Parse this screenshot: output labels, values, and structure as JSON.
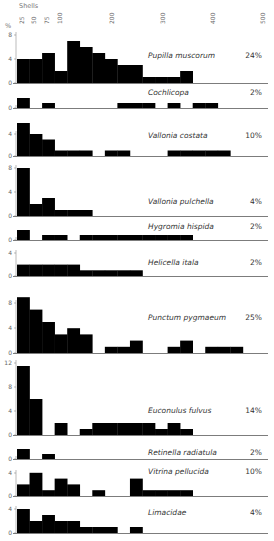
{
  "chart_data": {
    "type": "bar",
    "title": "",
    "xlabel": "Shells",
    "ylabel": "%",
    "x_ticks": [
      "25",
      "50",
      "75",
      "100",
      "200",
      "300",
      "400",
      "500"
    ],
    "x_tick_values": [
      25,
      50,
      75,
      100,
      200,
      300,
      400,
      500
    ],
    "bin_width": 25,
    "xlim": [
      0,
      500
    ],
    "grid": false,
    "legend": "none",
    "panels": [
      {
        "name": "Pupilla muscorum",
        "percent": "24%",
        "y_ticks": [
          "0",
          "4",
          "8"
        ],
        "ymax": 8,
        "values": [
          4,
          4,
          5,
          2,
          7,
          6,
          5,
          4,
          3,
          3,
          1,
          1,
          1,
          2
        ]
      },
      {
        "name": "Cochlicopa",
        "percent": "2%",
        "y_ticks": [
          "0"
        ],
        "ymax": 2,
        "values": [
          2,
          0,
          1,
          0,
          0,
          0,
          0,
          0,
          1,
          1,
          1,
          0,
          1,
          0,
          1,
          1
        ]
      },
      {
        "name": "Vallonia costata",
        "percent": "10%",
        "y_ticks": [
          "0",
          "4"
        ],
        "ymax": 6,
        "values": [
          6,
          4,
          3,
          1,
          1,
          1,
          0,
          1,
          1,
          0,
          0,
          0,
          1,
          1,
          1,
          1,
          1
        ]
      },
      {
        "name": "Vallonia pulchella",
        "percent": "4%",
        "y_ticks": [
          "0",
          "4",
          "8"
        ],
        "ymax": 8,
        "values": [
          8,
          2,
          3,
          1,
          1,
          1
        ]
      },
      {
        "name": "Hygromia hispida",
        "percent": "2%",
        "y_ticks": [
          "0"
        ],
        "ymax": 2,
        "values": [
          2,
          0,
          1,
          1,
          0,
          1,
          1,
          1,
          1,
          1,
          1,
          1,
          1,
          1
        ]
      },
      {
        "name": "Helicella itala",
        "percent": "2%",
        "y_ticks": [
          "0",
          "4"
        ],
        "ymax": 4,
        "values": [
          2,
          2,
          2,
          2,
          2,
          1,
          1,
          1,
          1,
          1
        ]
      },
      {
        "name": "Punctum pygmaeum",
        "percent": "25%",
        "y_ticks": [
          "0",
          "4",
          "8"
        ],
        "ymax": 9,
        "values": [
          9,
          7,
          5,
          3,
          4,
          3,
          0,
          1,
          1,
          2,
          0,
          0,
          1,
          2,
          0,
          1,
          1,
          1
        ]
      },
      {
        "name": "Euconulus fulvus",
        "percent": "14%",
        "y_ticks": [
          "0",
          "4",
          "8",
          "12"
        ],
        "ymax": 12,
        "values": [
          11.5,
          6,
          0,
          2,
          0,
          1,
          2,
          2,
          2,
          2,
          2,
          1,
          2,
          1
        ]
      },
      {
        "name": "Retinella radiatula",
        "percent": "2%",
        "y_ticks": [
          "0"
        ],
        "ymax": 2,
        "values": [
          2,
          0,
          1
        ]
      },
      {
        "name": "Vitrina pellucida",
        "percent": "10%",
        "y_ticks": [
          "0",
          "4"
        ],
        "ymax": 4,
        "values": [
          2,
          4,
          1,
          3,
          2,
          0,
          1,
          0,
          0,
          3,
          1,
          1,
          1,
          1
        ]
      },
      {
        "name": "Limacidae",
        "percent": "4%",
        "y_ticks": [
          "0",
          "4"
        ],
        "ymax": 4,
        "values": [
          4,
          2,
          3,
          2,
          2,
          1,
          1,
          1,
          0,
          1
        ]
      }
    ]
  },
  "layout": {
    "x0": 17,
    "bin_px": 12.55,
    "x_end": 268,
    "panels": [
      {
        "base": 83,
        "upx": 6.0,
        "ytick_px": [
          83,
          59,
          35
        ],
        "label_y": 58,
        "pct_y": 58
      },
      {
        "base": 108,
        "upx": 5.0,
        "ytick_px": [
          108
        ],
        "label_y": 95,
        "pct_y": 95
      },
      {
        "base": 156,
        "upx": 5.5,
        "ytick_px": [
          156,
          134
        ],
        "label_y": 138,
        "pct_y": 138
      },
      {
        "base": 216,
        "upx": 6.0,
        "ytick_px": [
          216,
          192,
          168
        ],
        "label_y": 204,
        "pct_y": 204
      },
      {
        "base": 240,
        "upx": 5.0,
        "ytick_px": [
          240
        ],
        "label_y": 229,
        "pct_y": 229
      },
      {
        "base": 276,
        "upx": 5.7,
        "ytick_px": [
          276,
          253
        ],
        "label_y": 265,
        "pct_y": 265
      },
      {
        "base": 353,
        "upx": 6.2,
        "ytick_px": [
          353,
          328,
          303
        ],
        "label_y": 320,
        "pct_y": 320
      },
      {
        "base": 435,
        "upx": 6.0,
        "ytick_px": [
          435,
          411,
          387,
          363
        ],
        "label_y": 413,
        "pct_y": 413
      },
      {
        "base": 459,
        "upx": 5.0,
        "ytick_px": [
          459
        ],
        "label_y": 455,
        "pct_y": 455
      },
      {
        "base": 496,
        "upx": 5.8,
        "ytick_px": [
          496,
          473
        ],
        "label_y": 474,
        "pct_y": 474
      },
      {
        "base": 533,
        "upx": 6.0,
        "ytick_px": [
          533,
          509
        ],
        "label_y": 515,
        "pct_y": 515
      }
    ],
    "xtick_px": [
      22,
      34,
      47,
      60,
      112,
      163,
      213,
      263
    ]
  }
}
